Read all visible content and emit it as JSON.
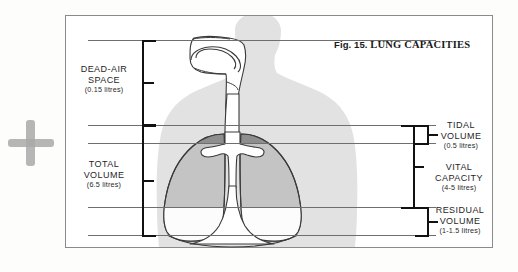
{
  "figure": {
    "number": "Fig. 15.",
    "title": "LUNG CAPACITIES"
  },
  "marks": {
    "plus_annotation": "plus-mark"
  },
  "labels": {
    "dead_air": {
      "name": "DEAD-AIR",
      "name2": "SPACE",
      "value": "(0.15 litres)"
    },
    "total_volume": {
      "name": "TOTAL",
      "name2": "VOLUME",
      "value": "(6.5 litres)"
    },
    "tidal_volume": {
      "name": "TIDAL",
      "name2": "VOLUME",
      "value": "(0.5 litres)"
    },
    "vital_capacity": {
      "name": "VITAL",
      "name2": "CAPACITY",
      "value": "(4-5 litres)"
    },
    "residual_volume": {
      "name": "RESIDUAL",
      "name2": "VOLUME",
      "value": "(1-1.5 litres)"
    }
  },
  "colors": {
    "body_silhouette": "#e0e0e0",
    "lung_upper_dark": "#9a9a9a",
    "lung_mid_grey": "#c2c2c2",
    "lung_lower_white": "#fdfdfd",
    "outline": "#3a3a3a",
    "rule_line": "#6e6e6e",
    "bracket": "#111111",
    "frame": "#8a8a8a",
    "plus_mark": "#a9a9a9"
  }
}
